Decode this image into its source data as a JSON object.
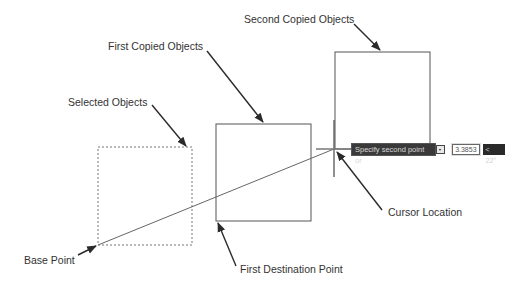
{
  "labels": {
    "second_copied": "Second Copied Objects",
    "first_copied": "First Copied Objects",
    "selected": "Selected Objects",
    "base_point": "Base Point",
    "first_destination": "First Destination Point",
    "cursor_location": "Cursor Location"
  },
  "tooltip": {
    "prompt": "Specify second point or",
    "icon": "dropdown-arrow-icon",
    "distance_value": "3.3853",
    "angle_value": "< 22°"
  },
  "colors": {
    "line": "#555555",
    "arrow": "#2a2a2a",
    "tooltip_bg": "#3a3a3a"
  }
}
